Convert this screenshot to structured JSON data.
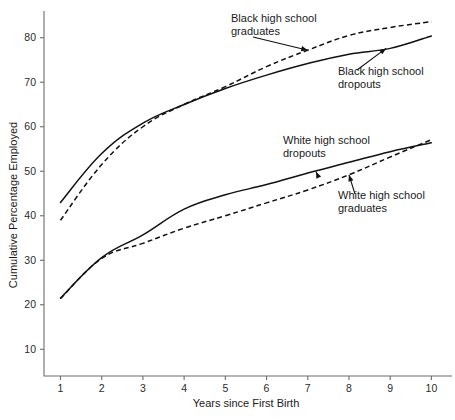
{
  "chart_data": {
    "type": "line",
    "title": "",
    "xlabel": "Years since First Birth",
    "ylabel": "Cumulative Percentage Employed",
    "x": [
      1,
      2,
      3,
      4,
      5,
      6,
      7,
      8,
      9,
      10
    ],
    "xlim": [
      0.6,
      10.5
    ],
    "ylim": [
      4,
      86
    ],
    "xticks": [
      "1",
      "2",
      "3",
      "4",
      "5",
      "6",
      "7",
      "8",
      "9",
      "10"
    ],
    "yticks": [
      "10",
      "20",
      "30",
      "40",
      "50",
      "60",
      "70",
      "80"
    ],
    "grid": false,
    "legend": "annotations-on-plot",
    "series": [
      {
        "name": "Black high school graduates",
        "style": "dashed",
        "values": [
          39.0,
          51.5,
          60.0,
          65.0,
          69.0,
          73.5,
          77.2,
          80.5,
          82.3,
          83.6
        ]
      },
      {
        "name": "Black high school dropouts",
        "style": "solid",
        "values": [
          43.0,
          54.0,
          60.8,
          65.0,
          68.6,
          71.6,
          74.2,
          76.3,
          77.6,
          80.4
        ]
      },
      {
        "name": "White high school dropouts",
        "style": "solid",
        "values": [
          21.5,
          30.6,
          35.7,
          41.5,
          44.7,
          47.0,
          49.6,
          52.0,
          54.4,
          56.4
        ]
      },
      {
        "name": "White high school graduates",
        "style": "dashed",
        "values": [
          21.4,
          30.4,
          33.8,
          37.2,
          40.0,
          42.9,
          45.8,
          49.2,
          53.2,
          57.1
        ]
      }
    ],
    "annotations": [
      {
        "label_line_1": "Black high school",
        "label_line_2": "graduates",
        "points_to": "Black high school graduates",
        "anchor_x": 7.0,
        "anchor_y": 77.2
      },
      {
        "label_line_1": "Black high school",
        "label_line_2": "dropouts",
        "points_to": "Black high school dropouts",
        "anchor_x": 8.9,
        "anchor_y": 77.6
      },
      {
        "label_line_1": "White high school",
        "label_line_2": "dropouts",
        "points_to": "White high school dropouts",
        "anchor_x": 7.2,
        "anchor_y": 49.9
      },
      {
        "label_line_1": "White high school",
        "label_line_2": "graduates",
        "points_to": "White high school graduates",
        "anchor_x": 8.0,
        "anchor_y": 49.2
      }
    ],
    "colors": {
      "line": "#111111",
      "axis": "#6d6d6d",
      "text": "#1a1a1a",
      "background": "#ffffff"
    }
  }
}
